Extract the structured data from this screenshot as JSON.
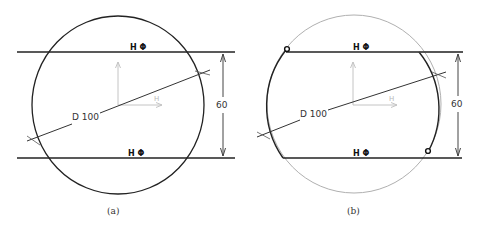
{
  "figures": [
    {
      "id": "a",
      "caption": "(a)",
      "diameter_label": "D 100",
      "dimension_label": "60",
      "top_constraint": "H Φ",
      "bottom_constraint": "H Φ",
      "axis_h_label": "H",
      "axis_v_label": "V",
      "circle_style": "full-dark"
    },
    {
      "id": "b",
      "caption": "(b)",
      "diameter_label": "D 100",
      "dimension_label": "60",
      "top_constraint": "H Φ",
      "bottom_constraint": "H Φ",
      "axis_h_label": "H",
      "axis_v_label": "V",
      "circle_style": "trimmed-arcs",
      "endpoints": 2
    }
  ],
  "colors": {
    "line": "#222222",
    "construction": "#b0b0b0",
    "axis": "#c4c4c4",
    "text": "#333333"
  }
}
